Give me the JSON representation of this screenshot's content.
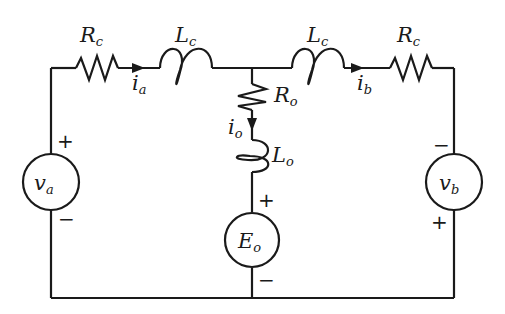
{
  "diagram": {
    "type": "circuit",
    "components": {
      "rc_left": {
        "symbol": "R",
        "sub": "c"
      },
      "lc_left": {
        "symbol": "L",
        "sub": "c"
      },
      "lc_right": {
        "symbol": "L",
        "sub": "c"
      },
      "rc_right": {
        "symbol": "R",
        "sub": "c"
      },
      "ro": {
        "symbol": "R",
        "sub": "o"
      },
      "lo": {
        "symbol": "L",
        "sub": "o"
      },
      "va": {
        "symbol": "v",
        "sub": "a"
      },
      "vb": {
        "symbol": "v",
        "sub": "b"
      },
      "eo": {
        "symbol": "E",
        "sub": "o"
      }
    },
    "currents": {
      "ia": {
        "symbol": "i",
        "sub": "a"
      },
      "ib": {
        "symbol": "i",
        "sub": "b"
      },
      "io": {
        "symbol": "i",
        "sub": "o"
      }
    },
    "polarity": {
      "plus": "+",
      "minus": "−"
    }
  }
}
